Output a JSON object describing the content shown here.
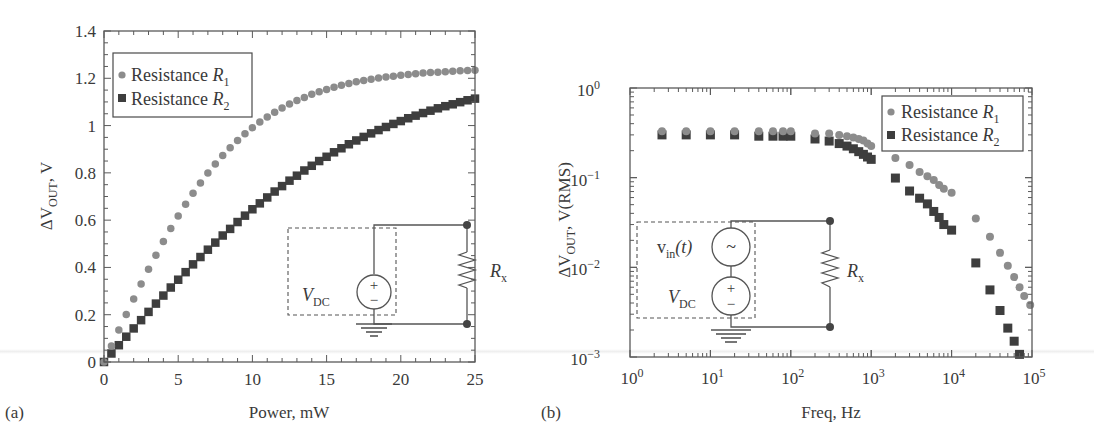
{
  "figure": {
    "panels": [
      {
        "id": "a",
        "label": "(a)"
      },
      {
        "id": "b",
        "label": "(b)"
      }
    ]
  },
  "colors": {
    "r1_marker": "#8c8c8c",
    "r2_marker": "#3e3e3e",
    "axis": "#5a5a5a",
    "text": "#3a3a3a"
  },
  "chart_data": [
    {
      "panel": "(a)",
      "type": "scatter",
      "title": "",
      "xlabel": "Power, mW",
      "ylabel": "ΔV_OUT, V",
      "ylabel_parts": {
        "delta": "ΔV",
        "sub": "OUT",
        "rest": ", V"
      },
      "xlim": [
        0,
        25
      ],
      "ylim": [
        0,
        1.4
      ],
      "x_scale": "linear",
      "y_scale": "linear",
      "xticks": [
        0,
        5,
        10,
        15,
        20,
        25
      ],
      "xtick_labels": [
        "0",
        "5",
        "10",
        "15",
        "20",
        "25"
      ],
      "yticks": [
        0,
        0.2,
        0.4,
        0.6,
        0.8,
        1.0,
        1.2,
        1.4
      ],
      "ytick_labels": [
        "0",
        "0.2",
        "0.4",
        "0.6",
        "0.8",
        "1",
        "1.2",
        "1.4"
      ],
      "grid": false,
      "legend_position": "upper left",
      "legend": [
        {
          "marker": "circle",
          "text": "Resistance ",
          "symbol": "R",
          "sub": "1"
        },
        {
          "marker": "square",
          "text": "Resistance ",
          "symbol": "R",
          "sub": "2"
        }
      ],
      "x": [
        0,
        0.5,
        1,
        1.5,
        2,
        2.5,
        3,
        3.5,
        4,
        4.5,
        5,
        5.5,
        6,
        6.5,
        7,
        7.5,
        8,
        8.5,
        9,
        9.5,
        10,
        10.5,
        11,
        11.5,
        12,
        12.5,
        13,
        13.5,
        14,
        14.5,
        15,
        15.5,
        16,
        16.5,
        17,
        17.5,
        18,
        18.5,
        19,
        19.5,
        20,
        20.5,
        21,
        21.5,
        22,
        22.5,
        23,
        23.5,
        24,
        24.5,
        25
      ],
      "series": [
        {
          "name": "Resistance R1",
          "marker": "circle",
          "values": [
            0,
            0.068,
            0.135,
            0.201,
            0.266,
            0.33,
            0.392,
            0.452,
            0.51,
            0.565,
            0.617,
            0.667,
            0.714,
            0.757,
            0.799,
            0.837,
            0.873,
            0.906,
            0.937,
            0.965,
            0.991,
            1.015,
            1.036,
            1.056,
            1.074,
            1.091,
            1.106,
            1.119,
            1.132,
            1.143,
            1.153,
            1.162,
            1.171,
            1.178,
            1.185,
            1.191,
            1.196,
            1.201,
            1.205,
            1.209,
            1.213,
            1.216,
            1.219,
            1.222,
            1.224,
            1.226,
            1.228,
            1.23,
            1.232,
            1.233,
            1.234
          ]
        },
        {
          "name": "Resistance R2",
          "marker": "square",
          "values": [
            0,
            0.036,
            0.071,
            0.107,
            0.142,
            0.177,
            0.212,
            0.247,
            0.281,
            0.315,
            0.348,
            0.38,
            0.413,
            0.444,
            0.475,
            0.505,
            0.535,
            0.563,
            0.592,
            0.619,
            0.646,
            0.671,
            0.696,
            0.721,
            0.744,
            0.767,
            0.788,
            0.81,
            0.83,
            0.85,
            0.868,
            0.887,
            0.904,
            0.921,
            0.937,
            0.952,
            0.967,
            0.981,
            0.994,
            1.007,
            1.019,
            1.031,
            1.042,
            1.053,
            1.063,
            1.073,
            1.082,
            1.09,
            1.099,
            1.107,
            1.114
          ]
        }
      ],
      "inset_circuit": {
        "source_label": "V",
        "source_sub": "DC",
        "resistor_label": "R",
        "resistor_sub": "x"
      }
    },
    {
      "panel": "(b)",
      "type": "scatter",
      "title": "",
      "xlabel": "Freq, Hz",
      "ylabel": "ΔV_OUT, V(RMS)",
      "ylabel_parts": {
        "delta": "ΔV",
        "sub": "OUT",
        "rest": ", V(RMS)"
      },
      "xlim": [
        1,
        100000
      ],
      "ylim": [
        0.001,
        1
      ],
      "x_scale": "log",
      "y_scale": "log",
      "xticks": [
        1,
        10,
        100,
        1000,
        10000,
        100000
      ],
      "xtick_labels": [
        {
          "base": "10",
          "exp": "0"
        },
        {
          "base": "10",
          "exp": "1"
        },
        {
          "base": "10",
          "exp": "2"
        },
        {
          "base": "10",
          "exp": "3"
        },
        {
          "base": "10",
          "exp": "4"
        },
        {
          "base": "10",
          "exp": "5"
        }
      ],
      "yticks": [
        1,
        0.1,
        0.01,
        0.001
      ],
      "ytick_labels": [
        {
          "base": "10",
          "exp": "0"
        },
        {
          "base": "10",
          "exp": "−1"
        },
        {
          "base": "10",
          "exp": "−2"
        },
        {
          "base": "10",
          "exp": "−3"
        }
      ],
      "grid": false,
      "legend_position": "upper right",
      "legend": [
        {
          "marker": "circle",
          "text": "Resistance ",
          "symbol": "R",
          "sub": "1"
        },
        {
          "marker": "square",
          "text": "Resistance ",
          "symbol": "R",
          "sub": "2"
        }
      ],
      "series": [
        {
          "name": "Resistance R1",
          "marker": "circle",
          "x": [
            2.5,
            5,
            10,
            20,
            40,
            60,
            80,
            100,
            200,
            300,
            400,
            500,
            600,
            700,
            800,
            900,
            1000,
            2000,
            3000,
            4000,
            5000,
            6000,
            7000,
            8000,
            10000,
            20000,
            30000,
            40000,
            50000,
            60000,
            70000,
            80000,
            95000
          ],
          "values": [
            0.33,
            0.33,
            0.33,
            0.33,
            0.33,
            0.33,
            0.33,
            0.33,
            0.31,
            0.31,
            0.3,
            0.29,
            0.28,
            0.27,
            0.26,
            0.24,
            0.225,
            0.166,
            0.138,
            0.116,
            0.104,
            0.094,
            0.083,
            0.075,
            0.068,
            0.035,
            0.022,
            0.0145,
            0.0104,
            0.0078,
            0.006,
            0.0048,
            0.0038
          ]
        },
        {
          "name": "Resistance R2",
          "marker": "square",
          "x": [
            2.5,
            5,
            10,
            20,
            40,
            60,
            80,
            100,
            200,
            300,
            400,
            500,
            600,
            700,
            800,
            900,
            1000,
            2000,
            3000,
            4000,
            5000,
            6000,
            7000,
            8000,
            10000,
            20000,
            30000,
            40000,
            50000,
            60000,
            70000
          ],
          "values": [
            0.3,
            0.3,
            0.3,
            0.3,
            0.29,
            0.29,
            0.29,
            0.29,
            0.27,
            0.256,
            0.24,
            0.225,
            0.21,
            0.195,
            0.182,
            0.17,
            0.16,
            0.099,
            0.071,
            0.059,
            0.051,
            0.042,
            0.036,
            0.03,
            0.026,
            0.0112,
            0.0056,
            0.0033,
            0.0021,
            0.0015,
            0.00107
          ]
        }
      ],
      "inset_circuit": {
        "ac_source_label": "v",
        "ac_source_sub": "in",
        "ac_source_arg": "(t)",
        "ac_symbol": "~",
        "source_label": "V",
        "source_sub": "DC",
        "resistor_label": "R",
        "resistor_sub": "x"
      }
    }
  ]
}
